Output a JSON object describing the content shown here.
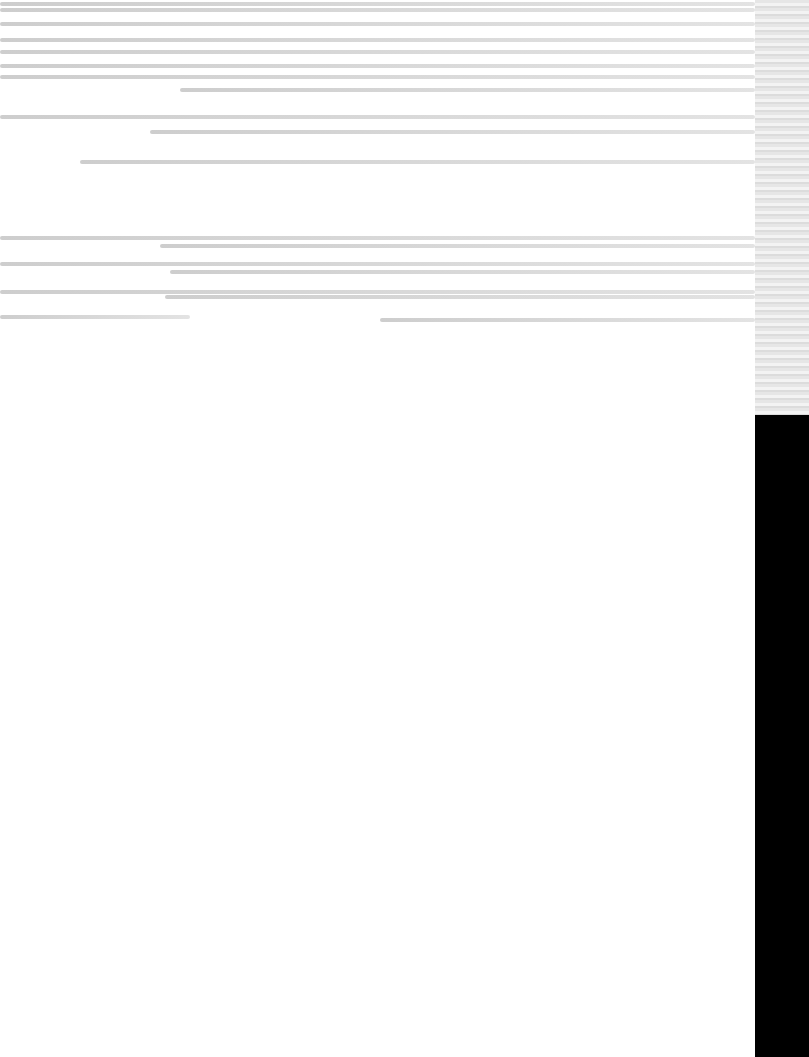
{
  "screen": {
    "state": "corrupted-render",
    "legible_text": []
  },
  "colors": {
    "background": "#ffffff",
    "streak": "#d0d0d0",
    "right_panel": "#000000"
  },
  "streaks": [
    {
      "top": 2,
      "left": 0,
      "width": 755
    },
    {
      "top": 8,
      "left": 0,
      "width": 755
    },
    {
      "top": 22,
      "left": 0,
      "width": 755
    },
    {
      "top": 38,
      "left": 0,
      "width": 755
    },
    {
      "top": 50,
      "left": 0,
      "width": 755
    },
    {
      "top": 64,
      "left": 0,
      "width": 755
    },
    {
      "top": 75,
      "left": 0,
      "width": 755
    },
    {
      "top": 88,
      "left": 180,
      "width": 575
    },
    {
      "top": 115,
      "left": 0,
      "width": 755
    },
    {
      "top": 130,
      "left": 150,
      "width": 605
    },
    {
      "top": 160,
      "left": 80,
      "width": 675
    },
    {
      "top": 236,
      "left": 0,
      "width": 755
    },
    {
      "top": 244,
      "left": 160,
      "width": 595
    },
    {
      "top": 262,
      "left": 0,
      "width": 755
    },
    {
      "top": 270,
      "left": 170,
      "width": 585
    },
    {
      "top": 290,
      "left": 0,
      "width": 755
    },
    {
      "top": 295,
      "left": 165,
      "width": 590
    },
    {
      "top": 315,
      "left": 0,
      "width": 190
    },
    {
      "top": 318,
      "left": 380,
      "width": 375
    }
  ]
}
